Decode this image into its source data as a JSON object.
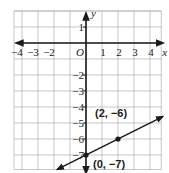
{
  "chart_data": {
    "type": "line",
    "title": "",
    "xlabel": "x",
    "ylabel": "y",
    "origin_label": "O",
    "xlim": [
      -5,
      5
    ],
    "ylim": [
      -8,
      2
    ],
    "grid": true,
    "x_ticks": [
      {
        "value": -4,
        "label": "−4"
      },
      {
        "value": -3,
        "label": "−3"
      },
      {
        "value": -2,
        "label": "−2"
      },
      {
        "value": 1,
        "label": "1"
      },
      {
        "value": 2,
        "label": "2"
      },
      {
        "value": 3,
        "label": "3"
      },
      {
        "value": 4,
        "label": "4"
      }
    ],
    "y_ticks": [
      {
        "value": 1,
        "label": "1"
      },
      {
        "value": -2,
        "label": "−2"
      },
      {
        "value": -3,
        "label": "−3"
      },
      {
        "value": -4,
        "label": "−4"
      },
      {
        "value": -5,
        "label": "−5"
      },
      {
        "value": -6,
        "label": "−6"
      },
      {
        "value": -7,
        "label": "−7"
      }
    ],
    "series": [
      {
        "name": "line",
        "slope": 0.5,
        "intercept": -7,
        "x": [
          -1.8,
          4.8
        ],
        "y": [
          -7.9,
          -4.6
        ]
      }
    ],
    "points": [
      {
        "x": 2,
        "y": -6,
        "label": "(2, −6)"
      },
      {
        "x": 0,
        "y": -7,
        "label": "(0, −7)"
      }
    ],
    "colors": {
      "grid": "#b8b8b8",
      "axis": "#1a1a1a",
      "line": "#1a1a1a",
      "point": "#1a1a1a"
    }
  }
}
